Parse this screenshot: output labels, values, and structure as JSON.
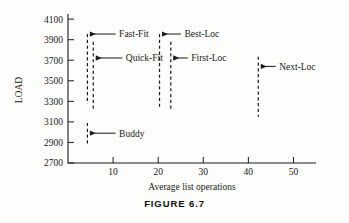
{
  "caption": "FIGURE 6.7",
  "chart_data": {
    "type": "bar",
    "title": "",
    "xlabel": "Average list operations",
    "ylabel": "LOAD",
    "xlim": [
      0,
      55
    ],
    "ylim": [
      2700,
      4150
    ],
    "grid": false,
    "legend": "none",
    "orientation": "vertical-range-bars",
    "xticks": [
      10,
      20,
      30,
      40,
      50
    ],
    "yticks": [
      2700,
      2900,
      3100,
      3300,
      3500,
      3700,
      3900,
      4100
    ],
    "xtick_labels": [
      "10",
      "20",
      "30",
      "40",
      "50"
    ],
    "ytick_labels": [
      "2700",
      "2900",
      "3100",
      "3300",
      "3500",
      "3700",
      "3900",
      "4100"
    ],
    "annotations": [
      {
        "name": "Fast-Fit",
        "x": 4.3,
        "load_top": 3955,
        "load_bottom": 3275,
        "arrow_at_load": 3955,
        "label_x": 11.0,
        "label_load": 3955
      },
      {
        "name": "Quick-Fit",
        "x": 5.6,
        "load_top": 3880,
        "load_bottom": 3215,
        "arrow_at_load": 3722,
        "label_x": 12.5,
        "label_load": 3722
      },
      {
        "name": "Best-Loc",
        "x": 20.3,
        "load_top": 3955,
        "load_bottom": 3228,
        "arrow_at_load": 3955,
        "label_x": 25.5,
        "label_load": 3955
      },
      {
        "name": "First-Loc",
        "x": 22.8,
        "load_top": 3880,
        "load_bottom": 3228,
        "arrow_at_load": 3722,
        "label_x": 27.0,
        "label_load": 3722
      },
      {
        "name": "Next-Loc",
        "x": 42.2,
        "load_top": 3735,
        "load_bottom": 3150,
        "arrow_at_load": 3640,
        "label_x": 46.5,
        "label_load": 3640
      },
      {
        "name": "Buddy",
        "x": 4.3,
        "load_top": 3090,
        "load_bottom": 2880,
        "arrow_at_load": 2990,
        "label_x": 11.0,
        "label_load": 2990
      }
    ],
    "series": [
      {
        "name": "Fast-Fit",
        "x": 4.3,
        "values": [
          3275,
          3955
        ]
      },
      {
        "name": "Quick-Fit",
        "x": 5.6,
        "values": [
          3215,
          3880
        ]
      },
      {
        "name": "Best-Loc",
        "x": 20.3,
        "values": [
          3228,
          3955
        ]
      },
      {
        "name": "First-Loc",
        "x": 22.8,
        "values": [
          3228,
          3880
        ]
      },
      {
        "name": "Next-Loc",
        "x": 42.2,
        "values": [
          3150,
          3735
        ]
      },
      {
        "name": "Buddy",
        "x": 4.3,
        "values": [
          2880,
          3090
        ]
      }
    ]
  }
}
